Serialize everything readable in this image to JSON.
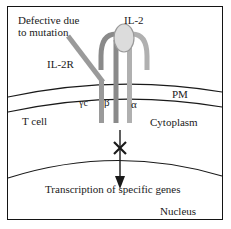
{
  "figure": {
    "border_color": "#141414",
    "background": "#ffffff"
  },
  "labels": {
    "defective": "Defective due\nto mutation",
    "defective_line1": "Defective due",
    "defective_line2": "to mutation",
    "il2": "IL-2",
    "il2r": "IL-2R",
    "pm": "PM",
    "t_cell": "T cell",
    "cytoplasm": "Cytoplasm",
    "gamma_c": "γc",
    "beta": "β",
    "alpha": "α",
    "transcription": "Transcription of specific genes",
    "nucleus": "Nucleus"
  },
  "colors": {
    "outline": "#141414",
    "membrane_line": "#1a1a1a",
    "chain_gamma": "#9a9a9a",
    "chain_beta": "#8a8a8a",
    "chain_alpha": "#b0b0b0",
    "ligand_fill": "#d9d9d9",
    "ligand_stroke": "#8c8c8c",
    "arrow": "#1a1a1a",
    "block_mark": "#1a1a1a",
    "text": "#1a1a1a"
  },
  "elements": {
    "ligand_shape": "ellipse",
    "block_mark_shape": "x-cross",
    "arrow_direction": "down",
    "membrane_lines": 2,
    "nuclear_envelope_lines": 1
  }
}
